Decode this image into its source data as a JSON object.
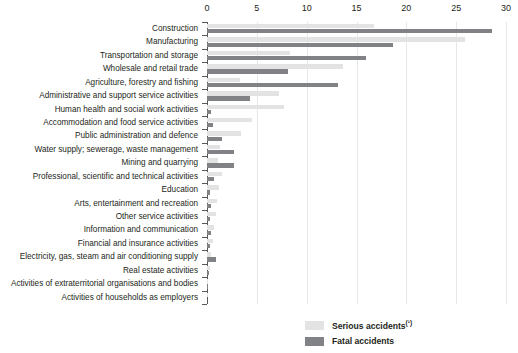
{
  "chart_data": {
    "type": "bar",
    "orientation": "horizontal",
    "title": "",
    "subtitle": "",
    "xlabel": "",
    "ylabel": "",
    "xlim": [
      0,
      30
    ],
    "xticks": [
      0,
      5,
      10,
      15,
      20,
      25,
      30
    ],
    "xtick_labels": [
      "0",
      "5",
      "10",
      "15",
      "20",
      "25",
      "30"
    ],
    "grid": true,
    "grid_axis": "x",
    "legend_position": "bottom-right",
    "categories": [
      "Construction",
      "Manufacturing",
      "Transportation and storage",
      "Wholesale and retail trade",
      "Agriculture, forestry and fishing",
      "Administrative and support service activities",
      "Human health and social work activities",
      "Accommodation and food service activities",
      "Public administration and defence",
      "Water supply; sewerage, waste management",
      "Mining and quarrying",
      "Professional, scientific and technical activities",
      "Education",
      "Arts, entertainment and recreation",
      "Other service activities",
      "Information and communication",
      "Financial and insurance activities",
      "Electricity, gas, steam and air conditioning supply",
      "Real estate activities",
      "Activities of extraterritorial organisations and bodies",
      "Activities of households as employers"
    ],
    "series": [
      {
        "name": "Serious accidents (¹)",
        "color": "#e3e3e3",
        "values": [
          16.8,
          25.9,
          8.3,
          13.6,
          3.3,
          7.2,
          7.7,
          4.5,
          3.4,
          1.3,
          1.1,
          1.5,
          1.2,
          1.0,
          0.9,
          0.7,
          0.6,
          0.4,
          0.3,
          0.1,
          0.05
        ]
      },
      {
        "name": "Fatal accidents",
        "color": "#808285",
        "values": [
          28.6,
          18.7,
          16.0,
          8.1,
          13.1,
          4.3,
          0.4,
          0.6,
          1.5,
          2.7,
          2.7,
          0.7,
          0.3,
          0.4,
          0.3,
          0.4,
          0.3,
          0.9,
          0.2,
          0.05,
          0.0
        ]
      }
    ]
  },
  "legend": {
    "items": [
      {
        "label_main": "Serious accidents",
        "footnote": "(¹)",
        "swatch": "serious-swatch"
      },
      {
        "label_main": "Fatal accidents",
        "footnote": "",
        "swatch": "fatal-swatch"
      }
    ]
  }
}
